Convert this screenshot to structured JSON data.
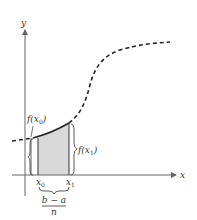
{
  "diagram": {
    "axes": {
      "x_label": "x",
      "y_label": "y"
    },
    "labels": {
      "f_x0": "f(x",
      "f_x0_sub": "0",
      "f_x1": "f(x",
      "f_x1_sub": "1",
      "close_paren": ")",
      "x0": "x",
      "x0_sub": "0",
      "x1": "x",
      "x1_sub": "1",
      "width_numerator": "b − a",
      "width_denominator": "n"
    },
    "colors": {
      "axis": "#666666",
      "curve": "#222222",
      "shade": "#d9d9d9",
      "bracket": "#333333"
    }
  }
}
